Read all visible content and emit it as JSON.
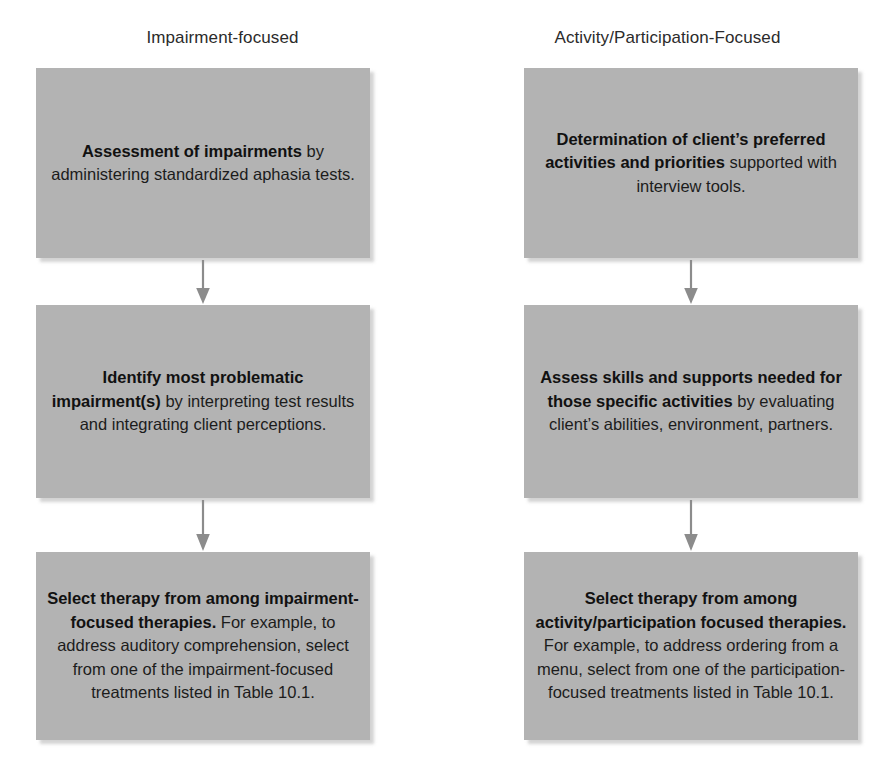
{
  "diagram": {
    "colors": {
      "box_fill": "#b3b3b3",
      "box_shadow": "#969696",
      "text": "#1c1c1c",
      "arrow": "#8c8c8c",
      "background": "#ffffff"
    },
    "columns": [
      {
        "id": "impairment-focused",
        "header": "Impairment-focused",
        "nodes": [
          {
            "id": "l1",
            "bold": "Assessment of impairments",
            "rest": " by administering standardized aphasia tests."
          },
          {
            "id": "l2",
            "bold": "Identify most problematic impairment(s)",
            "rest": " by interpreting test results and integrating client perceptions."
          },
          {
            "id": "l3",
            "bold": "Select therapy from among impairment-focused therapies.",
            "rest": " For example, to address auditory comprehension, select from one of the impairment-focused treatments listed in Table 10.1."
          }
        ],
        "arrows": [
          {
            "id": "l-arrow-1",
            "from": "l1",
            "to": "l2",
            "direction": "down"
          },
          {
            "id": "l-arrow-2",
            "from": "l2",
            "to": "l3",
            "direction": "down"
          }
        ]
      },
      {
        "id": "activity-participation-focused",
        "header": "Activity/Participation-Focused",
        "nodes": [
          {
            "id": "r1",
            "bold": "Determination of client’s preferred activities and priorities",
            "rest": " supported with interview tools."
          },
          {
            "id": "r2",
            "bold": "Assess skills and supports needed for those specific activities",
            "rest": " by evaluating client’s abilities, environment, partners."
          },
          {
            "id": "r3",
            "bold": "Select therapy from among activity/participation focused therapies.",
            "rest": " For example, to address ordering from a menu, select from one of the participation-focused treatments listed in Table 10.1."
          }
        ],
        "arrows": [
          {
            "id": "r-arrow-1",
            "from": "r1",
            "to": "r2",
            "direction": "down"
          },
          {
            "id": "r-arrow-2",
            "from": "r2",
            "to": "r3",
            "direction": "down"
          }
        ]
      }
    ]
  }
}
